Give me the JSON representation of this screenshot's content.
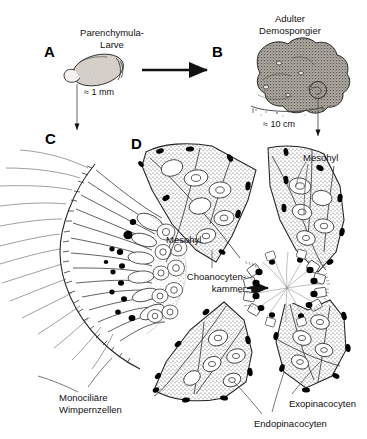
{
  "figure": {
    "background": "#ffffff",
    "ink": "#111111"
  },
  "panels": [
    {
      "id": "A",
      "letter": "A",
      "x": 44,
      "y": 44
    },
    {
      "id": "B",
      "letter": "B",
      "x": 212,
      "y": 44
    },
    {
      "id": "C",
      "letter": "C",
      "x": 45,
      "y": 131
    },
    {
      "id": "D",
      "letter": "D",
      "x": 131,
      "y": 136
    }
  ],
  "labels": {
    "larva": "Parenchymula-\nLarve",
    "adult": "Adulter\nDemospongier",
    "larva_scale": "≈ 1 mm",
    "adult_scale": "≈ 10 cm",
    "mesohyl_left": "Mesohyl",
    "mesohyl_right": "Mesohyl",
    "choanocyte_chamber": "Choanocyten-\nkammer",
    "monociliary_cells": "Monociliäre\nWimpernzellen",
    "exopinacocytes": "Exopinacocyten",
    "endopinacocytes": "Endopinacocyten"
  },
  "arrows": [
    {
      "name": "arrow-larva-to-adult",
      "from": "A",
      "to": "B",
      "direction": "right",
      "thick": true
    },
    {
      "name": "arrow-larva-to-section",
      "from": "A",
      "to": "C",
      "direction": "down",
      "thick": false
    },
    {
      "name": "arrow-adult-to-section",
      "from": "B",
      "to": "D",
      "direction": "down",
      "thick": false
    },
    {
      "name": "arrow-choanocyte-pointer",
      "from": "label",
      "to": "chamber",
      "direction": "right",
      "thick": true
    }
  ],
  "colors": {
    "ink": "#111111",
    "stipple": "#555555",
    "nucleus": "#000000",
    "leader": "#555555",
    "larva_fill": "#d8d4cc",
    "sponge_fill": "#9a958c"
  }
}
